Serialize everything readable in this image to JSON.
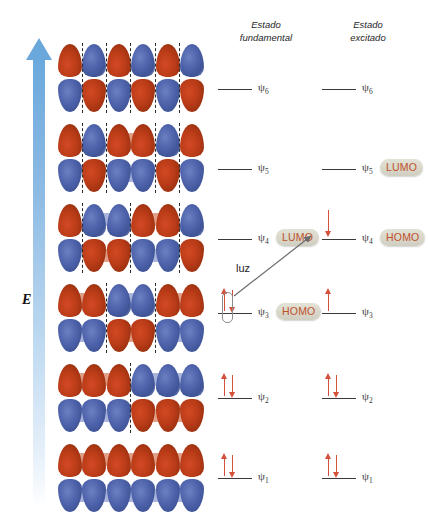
{
  "figure": {
    "energy_axis_label": "E",
    "transition_label": "luz"
  },
  "columns": [
    {
      "id": "ground",
      "title_line1": "Estado",
      "title_line2": "fundamental"
    },
    {
      "id": "excited",
      "title_line1": "Estado",
      "title_line2": "excitado"
    }
  ],
  "orbitals": [
    {
      "name": "psi6",
      "label": "ψ6",
      "symbol": "ψ",
      "index": "6",
      "nodes": 5,
      "top": 0
    },
    {
      "name": "psi5",
      "label": "ψ5",
      "symbol": "ψ",
      "index": "5",
      "nodes": 4,
      "top": 80
    },
    {
      "name": "psi4",
      "label": "ψ4",
      "symbol": "ψ",
      "index": "4",
      "nodes": 3,
      "top": 160
    },
    {
      "name": "psi3",
      "label": "ψ3",
      "symbol": "ψ",
      "index": "3",
      "nodes": 2,
      "top": 240
    },
    {
      "name": "psi2",
      "label": "ψ2",
      "symbol": "ψ",
      "index": "2",
      "nodes": 1,
      "top": 320
    },
    {
      "name": "psi1",
      "label": "ψ1",
      "symbol": "ψ",
      "index": "1",
      "nodes": 0,
      "top": 400
    }
  ],
  "ground_state": {
    "levels": [
      {
        "orbital": "ψ",
        "index": "6",
        "electrons": 0,
        "badge": null
      },
      {
        "orbital": "ψ",
        "index": "5",
        "electrons": 0,
        "badge": null
      },
      {
        "orbital": "ψ",
        "index": "4",
        "electrons": 0,
        "badge": "LUMO"
      },
      {
        "orbital": "ψ",
        "index": "3",
        "electrons": 2,
        "badge": "HOMO"
      },
      {
        "orbital": "ψ",
        "index": "2",
        "electrons": 2,
        "badge": null
      },
      {
        "orbital": "ψ",
        "index": "1",
        "electrons": 2,
        "badge": null
      }
    ]
  },
  "excited_state": {
    "levels": [
      {
        "orbital": "ψ",
        "index": "6",
        "electrons": 0,
        "badge": null
      },
      {
        "orbital": "ψ",
        "index": "5",
        "electrons": 0,
        "badge": "LUMO"
      },
      {
        "orbital": "ψ",
        "index": "4",
        "electrons": 1,
        "badge": "HOMO"
      },
      {
        "orbital": "ψ",
        "index": "3",
        "electrons": 1,
        "badge": null
      },
      {
        "orbital": "ψ",
        "index": "2",
        "electrons": 2,
        "badge": null
      },
      {
        "orbital": "ψ",
        "index": "1",
        "electrons": 2,
        "badge": null
      }
    ]
  },
  "colors": {
    "lobe_red": "#bb3c18",
    "lobe_blue": "#4f63ac",
    "spin_arrow": "#d4503a",
    "badge_text": "#c0512c",
    "badge_fill": "#d8d7ca",
    "axis_arrow": "#6aa8dc",
    "level_bar": "#3a3a3a"
  }
}
